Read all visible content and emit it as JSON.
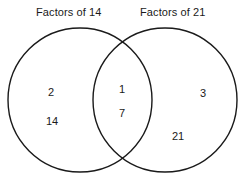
{
  "chart_data": {
    "type": "diagram",
    "diagram_type": "venn",
    "title": "",
    "sets": [
      {
        "id": "left",
        "label": "Factors of 14",
        "exclusive_members": [
          "2",
          "14"
        ]
      },
      {
        "id": "right",
        "label": "Factors of 21",
        "exclusive_members": [
          "3",
          "21"
        ]
      }
    ],
    "intersection": {
      "label": "",
      "members": [
        "1",
        "7"
      ]
    },
    "colors": {
      "background": "#ffffff",
      "stroke": "#1a1a1a",
      "text": "#1a1a1a",
      "fill": "none"
    },
    "stroke_width": 1.4
  },
  "labels": {
    "left_set_title": "Factors of 14",
    "right_set_title": "Factors of 21"
  },
  "items": {
    "left_only": [
      {
        "value": "2",
        "x": 51,
        "y": 92
      },
      {
        "value": "14",
        "x": 52,
        "y": 121
      }
    ],
    "intersection": [
      {
        "value": "1",
        "x": 122,
        "y": 89
      },
      {
        "value": "7",
        "x": 122,
        "y": 113
      }
    ],
    "right_only": [
      {
        "value": "3",
        "x": 203,
        "y": 93
      },
      {
        "value": "21",
        "x": 178,
        "y": 136
      }
    ]
  },
  "geometry": {
    "left_circle": {
      "cx": 80,
      "cy": 100,
      "r": 72
    },
    "right_circle": {
      "cx": 165,
      "cy": 100,
      "r": 72
    }
  }
}
